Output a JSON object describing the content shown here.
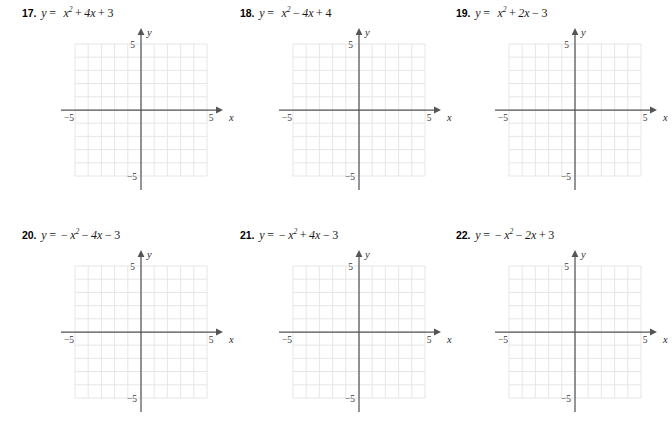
{
  "page": {
    "background_color": "#ffffff",
    "kind": "math-worksheet-graph-paper"
  },
  "style": {
    "grid_line_color": "#e3e3e6",
    "grid_major_color": "#dcdce0",
    "axis_color": "#555558",
    "text_color": "#1a1a1a",
    "number_color": "#000000"
  },
  "graph_template": {
    "x_axis_label": "x",
    "y_axis_label": "y",
    "x_min_label": "−5",
    "x_max_label": "5",
    "y_min_label": "−5",
    "y_max_label": "5",
    "x_range": [
      -5,
      5
    ],
    "y_range": [
      -5,
      5
    ],
    "grid_step": 1,
    "cells_across": 10,
    "cells_down": 10,
    "has_plotted_curve": false
  },
  "problems": [
    {
      "number": "17.",
      "equation_plain": "y = x² + 4x + 3",
      "lhs": "y",
      "equals": "=",
      "term1_base": "x",
      "term1_exp": "2",
      "op1": "+",
      "term2": "4x",
      "op2": "+",
      "term3": "3",
      "leading_sign": ""
    },
    {
      "number": "18.",
      "equation_plain": "y = x² − 4x + 4",
      "lhs": "y",
      "equals": "=",
      "term1_base": "x",
      "term1_exp": "2",
      "op1": "−",
      "term2": "4x",
      "op2": "+",
      "term3": "4",
      "leading_sign": ""
    },
    {
      "number": "19.",
      "equation_plain": "y = x² + 2x − 3",
      "lhs": "y",
      "equals": "=",
      "term1_base": "x",
      "term1_exp": "2",
      "op1": "+",
      "term2": "2x",
      "op2": "−",
      "term3": "3",
      "leading_sign": ""
    },
    {
      "number": "20.",
      "equation_plain": "y = −x² − 4x − 3",
      "lhs": "y",
      "equals": "=",
      "term1_base": "x",
      "term1_exp": "2",
      "op1": "−",
      "term2": "4x",
      "op2": "−",
      "term3": "3",
      "leading_sign": "−"
    },
    {
      "number": "21.",
      "equation_plain": "y = −x² + 4x − 3",
      "lhs": "y",
      "equals": "=",
      "term1_base": "x",
      "term1_exp": "2",
      "op1": "+",
      "term2": "4x",
      "op2": "−",
      "term3": "3",
      "leading_sign": "−"
    },
    {
      "number": "22.",
      "equation_plain": "y = −x² − 2x + 3",
      "lhs": "y",
      "equals": "=",
      "term1_base": "x",
      "term1_exp": "2",
      "op1": "−",
      "term2": "2x",
      "op2": "+",
      "term3": "3",
      "leading_sign": "−"
    }
  ]
}
